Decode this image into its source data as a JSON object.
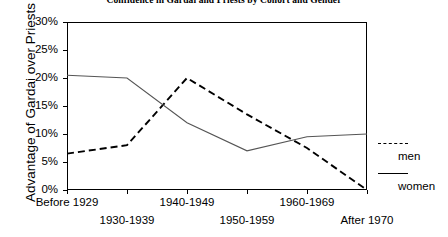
{
  "chart_data": {
    "type": "line",
    "title": "Confidence in Gardai and Priests by Cohort and Gender",
    "xlabel": "",
    "ylabel": "Advantage of Gardai over Priests",
    "categories": [
      "Before 1929",
      "1930-1939",
      "1940-1949",
      "1950-1959",
      "1960-1969",
      "After 1970"
    ],
    "ylim": [
      0,
      30
    ],
    "ytick_labels": [
      "0%",
      "5%",
      "10%",
      "15%",
      "20%",
      "25%",
      "30%"
    ],
    "ytick_values": [
      0,
      5,
      10,
      15,
      20,
      25,
      30
    ],
    "grid": false,
    "legend_position": "right",
    "series": [
      {
        "name": "men",
        "style": "dashed",
        "color": "#000000",
        "values": [
          6.5,
          8.0,
          20.0,
          13.5,
          7.5,
          0.0
        ]
      },
      {
        "name": "women",
        "style": "solid",
        "color": "#555555",
        "values": [
          20.5,
          20.0,
          12.0,
          7.0,
          9.5,
          10.0
        ]
      }
    ]
  },
  "legend": {
    "entries": [
      {
        "label": "men",
        "style": "dashed"
      },
      {
        "label": "women",
        "style": "solid"
      }
    ]
  }
}
